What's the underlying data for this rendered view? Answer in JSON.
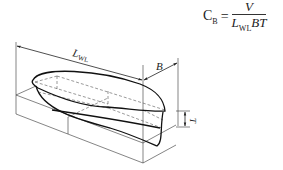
{
  "formula": {
    "lhs_symbol": "C",
    "lhs_subscript": "B",
    "equals": "=",
    "numerator": "V",
    "denominator_L": "L",
    "denominator_subscript": "WL",
    "denominator_rest": "BT"
  },
  "diagram": {
    "labels": {
      "length": "L",
      "length_subscript": "WL",
      "beam": "B",
      "draft": "T"
    },
    "colors": {
      "line": "#222222",
      "hull": "#111111",
      "dashed": "#555555"
    }
  }
}
